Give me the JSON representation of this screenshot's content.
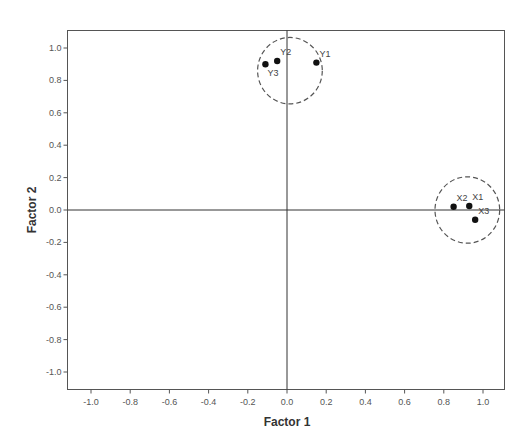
{
  "chart_data": {
    "type": "scatter",
    "title": "",
    "xlabel": "Factor 1",
    "ylabel": "Factor 2",
    "xlim": [
      -1.12,
      1.1
    ],
    "ylim": [
      -1.1,
      1.11
    ],
    "xticks": [
      -1.0,
      -0.8,
      -0.6,
      -0.4,
      -0.2,
      0.0,
      0.2,
      0.4,
      0.6,
      0.8,
      1.0
    ],
    "yticks": [
      1.0,
      0.8,
      0.6,
      0.4,
      0.2,
      0.0,
      -0.2,
      -0.4,
      -0.6,
      -0.8,
      -1.0
    ],
    "xtick_labels": [
      "-1.0",
      "-0.8",
      "-0.6",
      "-0.4",
      "-0.2",
      "0.0",
      "0.2",
      "0.4",
      "0.6",
      "0.8",
      "1.0"
    ],
    "ytick_labels": [
      "1.0",
      "0.8",
      "0.6",
      "0.4",
      "0.2",
      "0.0",
      "-0.2",
      "-0.4",
      "-0.6",
      "-0.8",
      "-1.0"
    ],
    "grid": false,
    "reference_lines": {
      "x": 0.0,
      "y": 0.0
    },
    "points": [
      {
        "label": "Y1",
        "x": 0.15,
        "y": 0.91,
        "label_pos": "upper-right"
      },
      {
        "label": "Y2",
        "x": -0.05,
        "y": 0.92,
        "label_pos": "upper-right"
      },
      {
        "label": "Y3",
        "x": -0.11,
        "y": 0.9,
        "label_pos": "below"
      },
      {
        "label": "X1",
        "x": 0.93,
        "y": 0.025,
        "label_pos": "upper-right"
      },
      {
        "label": "X2",
        "x": 0.85,
        "y": 0.02,
        "label_pos": "upper-right"
      },
      {
        "label": "X3",
        "x": 0.96,
        "y": -0.06,
        "label_pos": "upper-right"
      }
    ],
    "clusters": [
      {
        "name": "Y-cluster",
        "center_x": 0.015,
        "center_y": 0.86,
        "radius_x": 0.165,
        "radius_y": 0.205,
        "style": "dashed"
      },
      {
        "name": "X-cluster",
        "center_x": 0.92,
        "center_y": 0.0,
        "radius_x": 0.165,
        "radius_y": 0.205,
        "style": "dashed"
      }
    ],
    "colors": {
      "points": "#111111",
      "axes": "#555555",
      "circles": "#555555"
    }
  }
}
